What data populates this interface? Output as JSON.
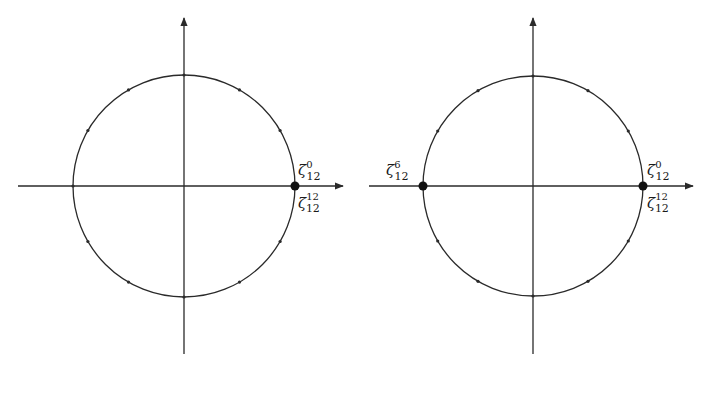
{
  "figure": {
    "stroke_color": "#2a2a2a",
    "panels": [
      {
        "id": "left",
        "center": [
          184,
          186
        ],
        "radius": 111,
        "h_axis": [
          18,
          343
        ],
        "v_axis": [
          18,
          354
        ],
        "tick_count": 12,
        "highlighted": [
          {
            "angle_deg": 0,
            "labels": [
              {
                "base": "ζ",
                "sup": "0",
                "sub": "12",
                "pos": "above-right"
              },
              {
                "base": "ζ",
                "sup": "12",
                "sub": "12",
                "pos": "below-right"
              }
            ]
          }
        ]
      },
      {
        "id": "right",
        "center": [
          533,
          186
        ],
        "radius": 110,
        "h_axis": [
          369,
          693
        ],
        "v_axis": [
          18,
          354
        ],
        "tick_count": 12,
        "highlighted": [
          {
            "angle_deg": 0,
            "labels": [
              {
                "base": "ζ",
                "sup": "0",
                "sub": "12",
                "pos": "above-right"
              },
              {
                "base": "ζ",
                "sup": "12",
                "sub": "12",
                "pos": "below-right"
              }
            ]
          },
          {
            "angle_deg": 180,
            "labels": [
              {
                "base": "ζ",
                "sup": "6",
                "sub": "12",
                "pos": "above-left"
              }
            ]
          }
        ]
      }
    ]
  },
  "labels": {
    "left_zeta0": {
      "base": "ζ",
      "sup": "0",
      "sub": "12"
    },
    "left_zeta12": {
      "base": "ζ",
      "sup": "12",
      "sub": "12"
    },
    "right_zeta0": {
      "base": "ζ",
      "sup": "0",
      "sub": "12"
    },
    "right_zeta12": {
      "base": "ζ",
      "sup": "12",
      "sub": "12"
    },
    "right_zeta6": {
      "base": "ζ",
      "sup": "6",
      "sub": "12"
    }
  }
}
